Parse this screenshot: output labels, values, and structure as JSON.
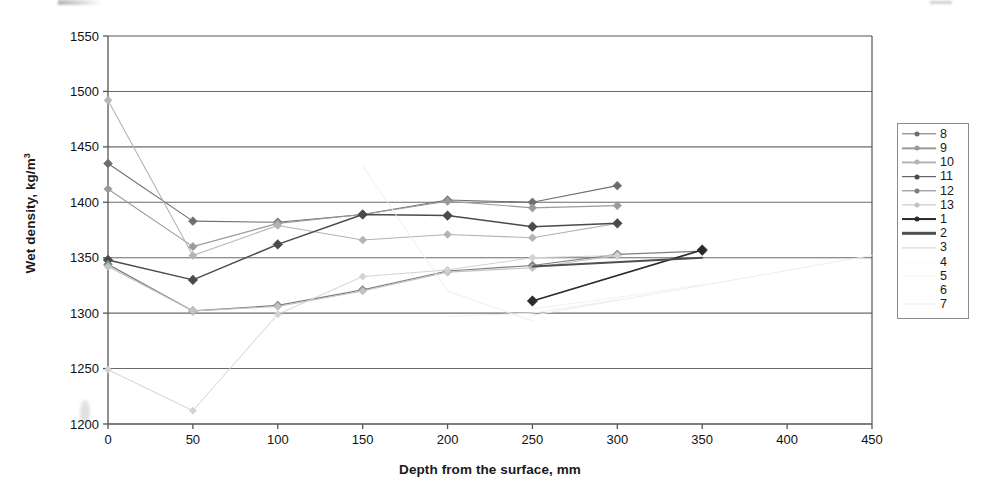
{
  "chart_data": {
    "type": "line",
    "title": "",
    "xlabel": "Depth from the surface, mm",
    "ylabel": "Wet density, kg/m",
    "ylabel_superscript": "3",
    "xlim": [
      0,
      450
    ],
    "ylim": [
      1200,
      1550
    ],
    "xticks": [
      0,
      50,
      100,
      150,
      200,
      250,
      300,
      350,
      400,
      450
    ],
    "yticks": [
      1200,
      1250,
      1300,
      1350,
      1400,
      1450,
      1500,
      1550
    ],
    "grid": "horizontal",
    "legend_position": "right-outside",
    "series": [
      {
        "name": "8",
        "color": "#6e6e6e",
        "width": 1.1,
        "marker": "diamond",
        "marker_size": 4.4,
        "x": [
          0,
          50,
          100,
          150,
          200,
          250,
          300
        ],
        "y": [
          1435,
          1383,
          1382,
          1389,
          1402,
          1400,
          1415
        ]
      },
      {
        "name": "9",
        "color": "#9a9a9a",
        "width": 1.1,
        "marker": "diamond",
        "marker_size": 4.2,
        "x": [
          0,
          50,
          100,
          150,
          200,
          250,
          300
        ],
        "y": [
          1412,
          1360,
          1381,
          1389,
          1401,
          1395,
          1397
        ]
      },
      {
        "name": "10",
        "color": "#b4b4b4",
        "width": 1.1,
        "marker": "diamond",
        "marker_size": 4.0,
        "x": [
          0,
          50,
          100,
          150,
          200,
          250,
          300
        ],
        "y": [
          1492,
          1352,
          1379,
          1366,
          1371,
          1368,
          1381
        ]
      },
      {
        "name": "11",
        "color": "#4a4a4a",
        "width": 1.5,
        "marker": "diamond",
        "marker_size": 4.8,
        "x": [
          0,
          50,
          100,
          150,
          200,
          250,
          300
        ],
        "y": [
          1348,
          1330,
          1362,
          1389,
          1388,
          1378,
          1381
        ]
      },
      {
        "name": "12",
        "color": "#7e7e7e",
        "width": 1.2,
        "marker": "diamond",
        "marker_size": 4.4,
        "x": [
          0,
          50,
          100,
          150,
          200,
          250,
          300,
          350
        ],
        "y": [
          1344,
          1302,
          1307,
          1321,
          1338,
          1343,
          1353,
          1356
        ]
      },
      {
        "name": "13",
        "color": "#c2c2c2",
        "width": 1.1,
        "marker": "diamond",
        "marker_size": 4.0,
        "x": [
          0,
          50,
          100,
          150,
          200,
          250,
          300
        ],
        "y": [
          1342,
          1302,
          1306,
          1320,
          1337,
          1341,
          1352
        ]
      },
      {
        "name": "1",
        "color": "#2b2b2b",
        "width": 1.7,
        "marker": "diamond",
        "marker_size": 5.2,
        "x": [
          250,
          350
        ],
        "y": [
          1311,
          1357
        ]
      },
      {
        "name": "2",
        "color": "#4f4f4f",
        "width": 2.0,
        "marker": "none",
        "marker_size": 0,
        "x": [
          250,
          350
        ],
        "y": [
          1342,
          1350
        ]
      },
      {
        "name": "3",
        "color": "#d2d2d2",
        "width": 1.0,
        "marker": "diamond",
        "marker_size": 3.6,
        "x": [
          0,
          50,
          100,
          150,
          200,
          250,
          300
        ],
        "y": [
          1249,
          1212,
          1299,
          1333,
          1339,
          1350,
          1352
        ]
      },
      {
        "name": "4",
        "color": "#eeeeee",
        "width": 1.0,
        "marker": "none",
        "marker_size": 0,
        "x": [
          150,
          200,
          250
        ],
        "y": [
          1433,
          1320,
          1293
        ]
      },
      {
        "name": "5",
        "color": "#f0f0f0",
        "width": 1.0,
        "marker": "none",
        "marker_size": 0,
        "x": [
          200,
          250,
          300
        ],
        "y": [
          1297,
          1300,
          1312
        ]
      },
      {
        "name": "6",
        "color": "#f2f2f2",
        "width": 1.0,
        "marker": "none",
        "marker_size": 0,
        "x": [
          250,
          300,
          350
        ],
        "y": [
          1304,
          1314,
          1326
        ]
      },
      {
        "name": "7",
        "color": "#ededed",
        "width": 1.0,
        "marker": "none",
        "marker_size": 0,
        "x": [
          250,
          450
        ],
        "y": [
          1298,
          1352
        ]
      }
    ]
  },
  "legend": {
    "entries": [
      {
        "label": "8",
        "color": "#6e6e6e",
        "marker": true,
        "line_width": 1.4
      },
      {
        "label": "9",
        "color": "#9a9a9a",
        "marker": true,
        "line_width": 1.3
      },
      {
        "label": "10",
        "color": "#b4b4b4",
        "marker": true,
        "line_width": 1.2
      },
      {
        "label": "11",
        "color": "#4a4a4a",
        "marker": true,
        "line_width": 1.7
      },
      {
        "label": "12",
        "color": "#7e7e7e",
        "marker": true,
        "line_width": 1.4
      },
      {
        "label": "13",
        "color": "#c2c2c2",
        "marker": true,
        "line_width": 1.2
      },
      {
        "label": "1",
        "color": "#2b2b2b",
        "marker": true,
        "line_width": 1.9
      },
      {
        "label": "2",
        "color": "#4f4f4f",
        "marker": false,
        "line_width": 2.4
      },
      {
        "label": "3",
        "color": "#cfcfcf",
        "marker": false,
        "line_width": 1.2
      },
      {
        "label": "4",
        "color": "#fbfbfb",
        "marker": false,
        "line_width": 0.8
      },
      {
        "label": "5",
        "color": "#f4f4f4",
        "marker": false,
        "line_width": 0.8
      },
      {
        "label": "6",
        "color": "#fbfbfb",
        "marker": false,
        "line_width": 0.8
      },
      {
        "label": "7",
        "color": "#ececec",
        "marker": false,
        "line_width": 1.0
      }
    ]
  },
  "axes": {
    "frame_color": "#555555",
    "grid_color": "#6a6a6a",
    "tick_font_size": 13
  }
}
